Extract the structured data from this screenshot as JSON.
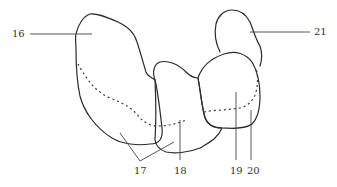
{
  "diagram": {
    "type": "anatomical line drawing",
    "background": "#ffffff",
    "stroke_color": "#2a2a2a",
    "labels": [
      {
        "id": "16",
        "text": "16"
      },
      {
        "id": "17",
        "text": "17"
      },
      {
        "id": "18",
        "text": "18"
      },
      {
        "id": "19",
        "text": "19"
      },
      {
        "id": "20",
        "text": "20"
      },
      {
        "id": "21",
        "text": "21"
      }
    ]
  }
}
